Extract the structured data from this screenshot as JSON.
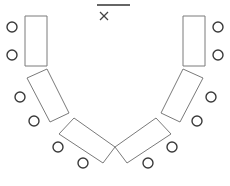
{
  "diagram": {
    "type": "seating-layout",
    "layout": "u-shape",
    "colors": {
      "table_stroke": "#7a7a7a",
      "chair_stroke": "#3a3a3a",
      "background": "#ffffff"
    },
    "front": {
      "board": {
        "x1": 97,
        "y1": 5,
        "x2": 130,
        "y2": 5
      },
      "presenter_mark": {
        "icon": "x-mark-icon",
        "cx": 104,
        "cy": 16,
        "size": 4
      }
    },
    "tables": [
      {
        "id": "left-top",
        "points": "25,16 47,16 47,66 25,66"
      },
      {
        "id": "left-middle",
        "points": "27,78 47,69 69,113 50,122"
      },
      {
        "id": "left-bottom",
        "points": "74,118 115,147 103,163 59,134"
      },
      {
        "id": "right-bottom",
        "points": "156,118 171,134 127,163 115,147"
      },
      {
        "id": "right-middle",
        "points": "183,69 203,78 180,122 161,113"
      },
      {
        "id": "right-top",
        "points": "183,16 205,16 205,66 183,66"
      }
    ],
    "chairs": [
      {
        "id": "left-top-1",
        "cx": 12,
        "cy": 27,
        "r": 5
      },
      {
        "id": "left-top-2",
        "cx": 12,
        "cy": 55,
        "r": 5
      },
      {
        "id": "left-middle-1",
        "cx": 20,
        "cy": 97,
        "r": 5
      },
      {
        "id": "left-middle-2",
        "cx": 34,
        "cy": 121,
        "r": 5
      },
      {
        "id": "left-bottom-1",
        "cx": 58,
        "cy": 147,
        "r": 5
      },
      {
        "id": "left-bottom-2",
        "cx": 83,
        "cy": 163,
        "r": 5
      },
      {
        "id": "right-bottom-1",
        "cx": 148,
        "cy": 163,
        "r": 5
      },
      {
        "id": "right-bottom-2",
        "cx": 172,
        "cy": 147,
        "r": 5
      },
      {
        "id": "right-middle-1",
        "cx": 211,
        "cy": 97,
        "r": 5
      },
      {
        "id": "right-middle-2",
        "cx": 197,
        "cy": 121,
        "r": 5
      },
      {
        "id": "right-top-1",
        "cx": 218,
        "cy": 27,
        "r": 5
      },
      {
        "id": "right-top-2",
        "cx": 218,
        "cy": 55,
        "r": 5
      }
    ],
    "counts": {
      "tables": 6,
      "chairs": 12
    }
  }
}
